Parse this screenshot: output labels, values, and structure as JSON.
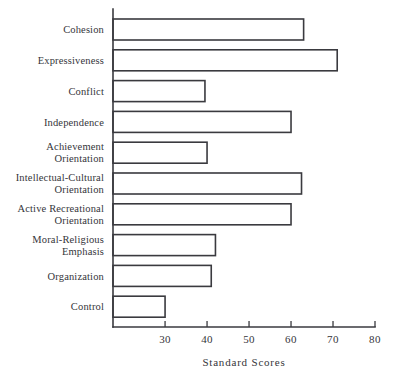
{
  "chart_data": {
    "type": "bar",
    "orientation": "horizontal",
    "title": "",
    "subtitle": "",
    "xlabel": "Standard Scores",
    "ylabel": "",
    "categories": [
      "Cohesion",
      "Expressiveness",
      "Conflict",
      "Independence",
      "Achievement Orientation",
      "Intellectual-Cultural Orientation",
      "Active Recreational Orientation",
      "Moral-Religious Emphasis",
      "Organization",
      "Control"
    ],
    "category_lines": [
      [
        "Cohesion"
      ],
      [
        "Expressiveness"
      ],
      [
        "Conflict"
      ],
      [
        "Independence"
      ],
      [
        "Achievement",
        "Orientation"
      ],
      [
        "Intellectual-Cultural",
        "Orientation"
      ],
      [
        "Active Recreational",
        "Orientation"
      ],
      [
        "Moral-Religious",
        "Emphasis"
      ],
      [
        "Organization"
      ],
      [
        "Control"
      ]
    ],
    "values": [
      63,
      71,
      39.5,
      60,
      40,
      62.5,
      60,
      42,
      41,
      30
    ],
    "xlim": [
      17.6,
      80
    ],
    "xticks": [
      30,
      40,
      50,
      60,
      70,
      80
    ],
    "xtick_labels": [
      "30",
      "40",
      "50",
      "60",
      "70",
      "80"
    ],
    "grid": false,
    "legend": "none",
    "bar_fill": "#ffffff",
    "bar_stroke": "#3a3a3f",
    "axis_color": "#3a3a3f",
    "background": "#ffffff"
  }
}
